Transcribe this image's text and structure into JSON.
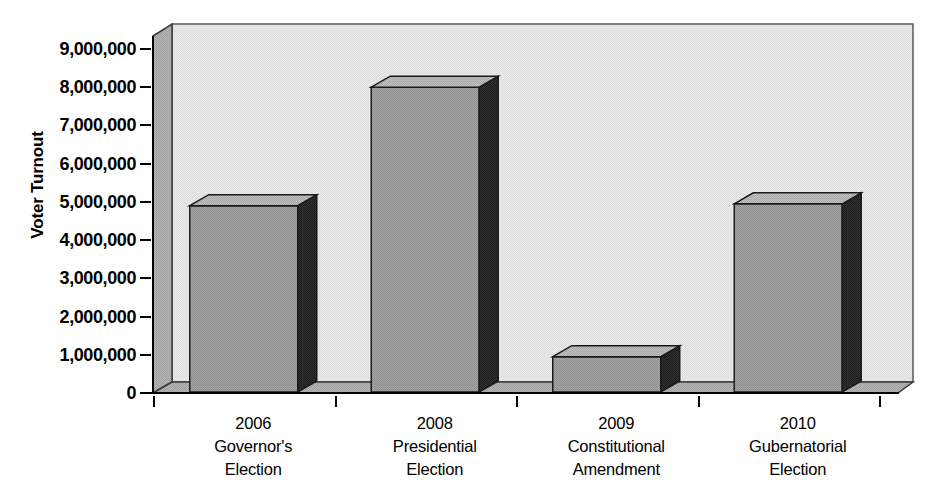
{
  "chart_data": {
    "type": "bar",
    "title": "",
    "subtitle": "",
    "xlabel": "",
    "ylabel": "Voter Turnout",
    "categories": [
      "2006 Governor's Election",
      "2008 Presidential Election",
      "2009 Constitutional Amendment",
      "2010 Gubernatorial Election"
    ],
    "category_lines": [
      [
        "2006",
        "Governor's",
        "Election"
      ],
      [
        "2008",
        "Presidential",
        "Election"
      ],
      [
        "2009",
        "Constitutional",
        "Amendment"
      ],
      [
        "2010",
        "Gubernatorial",
        "Election"
      ]
    ],
    "values": [
      4900000,
      8000000,
      950000,
      4950000
    ],
    "ylim": [
      0,
      9000000
    ],
    "ytick_values": [
      0,
      1000000,
      2000000,
      3000000,
      4000000,
      5000000,
      6000000,
      7000000,
      8000000,
      9000000
    ],
    "ytick_labels": [
      "0",
      "1,000,000",
      "2,000,000",
      "3,000,000",
      "4,000,000",
      "5,000,000",
      "6,000,000",
      "7,000,000",
      "8,000,000",
      "9,000,000"
    ],
    "grid": false,
    "legend": null,
    "legend_position": "none",
    "style": "3d-bar-grayscale",
    "colors": {
      "bar_front": "#9a9a9a",
      "bar_side": "#2b2b2b",
      "bar_top": "#b8b8b8",
      "plot_back_wall": "#e8e8e8",
      "plot_left_wall": "#b0b0b0",
      "plot_floor": "#b0b0b0",
      "axis_line": "#000000",
      "text": "#000000",
      "page_background": "#ffffff"
    }
  }
}
